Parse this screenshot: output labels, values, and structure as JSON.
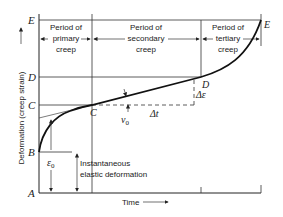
{
  "diagram": {
    "y_axis_label": "Deformation (creep strain)",
    "x_axis_label": "Time",
    "point_labels": {
      "A": "A",
      "B": "B",
      "C_axis": "C",
      "D_axis": "D",
      "E_axis": "E",
      "C_curve": "C",
      "D_curve": "D",
      "E_curve": "E"
    },
    "periods": [
      {
        "line1": "Period of",
        "line2": "primary",
        "line3": "creep"
      },
      {
        "line1": "Period of",
        "line2": "secondary",
        "line3": "creep"
      },
      {
        "line1": "Period of",
        "line2": "tertiary",
        "line3": "creep"
      }
    ],
    "annotations": {
      "epsilon0": "ε",
      "epsilon0_sub": "0",
      "v0": "v",
      "v0_sub": "0",
      "delta_t": "Δt",
      "delta_epsilon": "Δε",
      "instantaneous_line1": "Instantaneous",
      "instantaneous_line2": "elastic deformation"
    },
    "colors": {
      "line": "#222222",
      "background": "#ffffff"
    }
  }
}
